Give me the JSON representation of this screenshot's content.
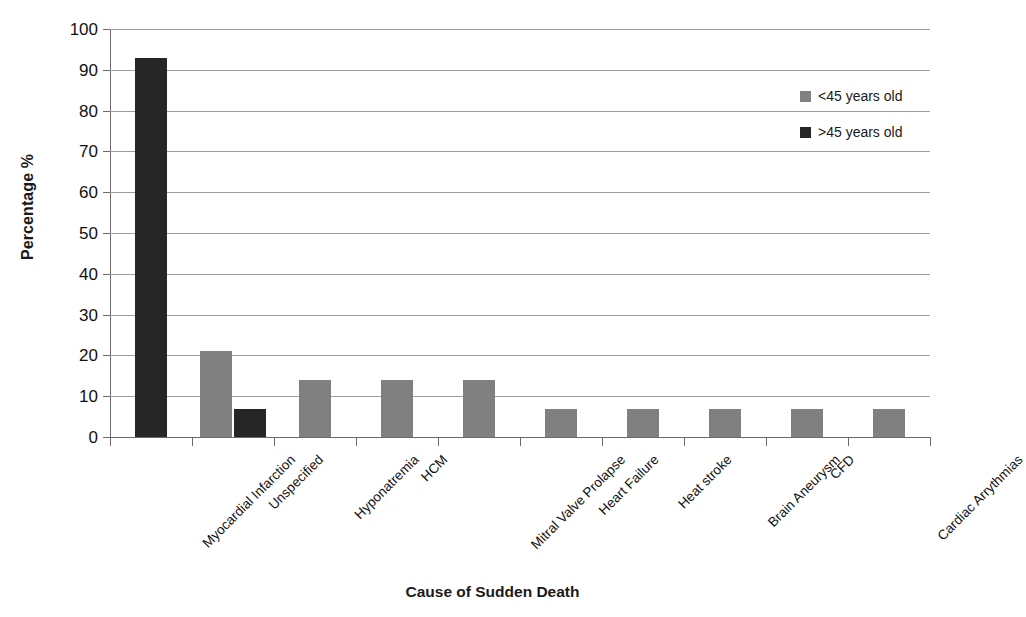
{
  "chart_data": {
    "type": "bar",
    "title": "",
    "xlabel": "Cause of Sudden Death",
    "ylabel": "Percentage %",
    "ylim": [
      0,
      100
    ],
    "ytick_step": 10,
    "yticks": [
      0,
      10,
      20,
      30,
      40,
      50,
      60,
      70,
      80,
      90,
      100
    ],
    "grid": "horizontal",
    "legend_position": "top-right",
    "categories": [
      "Myocardial Infarction",
      "Unspecified",
      "Hyponatremia",
      "HCM",
      "Mitral Valve Prolapse",
      "Heart Failure",
      "Heat stroke",
      "Brain Aneurysm",
      "CFD",
      "Cardiac Arrythmias"
    ],
    "series": [
      {
        "name": "<45 years old",
        "color": "#808080",
        "values": [
          0,
          21.0,
          13.9,
          13.9,
          13.9,
          6.9,
          6.9,
          6.9,
          6.9,
          6.9
        ]
      },
      {
        "name": ">45 years old",
        "color": "#262626",
        "values": [
          92.8,
          6.9,
          0,
          0,
          0,
          0,
          0,
          0,
          0,
          0
        ]
      }
    ]
  },
  "legend": {
    "entries": [
      {
        "label": "<45 years old",
        "color": "#808080"
      },
      {
        "label": ">45 years old",
        "color": "#262626"
      }
    ]
  },
  "axes": {
    "y_title": "Percentage %",
    "x_title": "Cause of Sudden Death"
  },
  "colors": {
    "series_young": "#808080",
    "series_old": "#262626",
    "gridline": "#9e9e9e",
    "axis": "#6b6b6b",
    "text": "#111111",
    "background": "#ffffff"
  }
}
